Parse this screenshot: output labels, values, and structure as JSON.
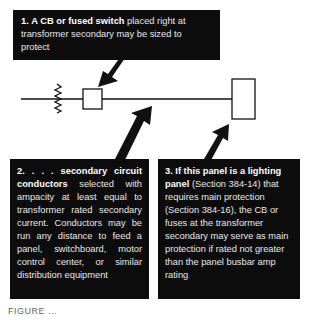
{
  "diagram": {
    "callouts": [
      {
        "number": "1.",
        "bold": "A CB or fused switch",
        "text": " placed right at transformer secondary may be sized to protect"
      },
      {
        "number": "2.",
        "bold": ". . . secondary circuit conductors",
        "text": " selected with ampacity at least equal to transformer rated secondary current. Conductors may be run any distance to feed a panel, switchboard, motor control center, or similar distribution equipment"
      },
      {
        "number": "3.",
        "bold": "If this panel is a lighting panel",
        "text": " (Section 384-14) that requires main protection (Section 384-16), the CB or fuses at the transformer secondary may serve as main protection if rated not greater than the panel busbar amp rating"
      }
    ],
    "symbols": [
      "transformer-secondary-coil",
      "circuit-breaker-box",
      "panel-box"
    ],
    "caption_partial": "FIGURE ..."
  }
}
